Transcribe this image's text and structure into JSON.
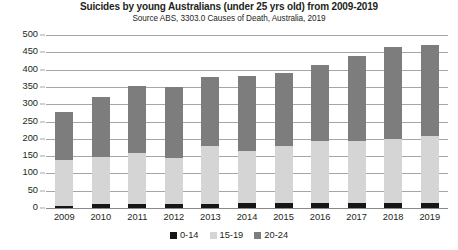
{
  "chart_data": {
    "type": "bar",
    "stacked": true,
    "title": "Suicides by young Australians (under 25 yrs old) from 2009-2019",
    "subtitle": "Source ABS, 3303.0 Causes of Death, Australia, 2019",
    "xlabel": "",
    "ylabel": "",
    "ylim": [
      0,
      500
    ],
    "ytick_step": 50,
    "yticks": [
      0,
      50,
      100,
      150,
      200,
      250,
      300,
      350,
      400,
      450,
      500
    ],
    "grid": true,
    "legend_position": "bottom",
    "categories": [
      "2009",
      "2010",
      "2011",
      "2012",
      "2013",
      "2014",
      "2015",
      "2016",
      "2017",
      "2018",
      "2019"
    ],
    "series": [
      {
        "name": "0-14",
        "color": "#161616",
        "values": [
          7,
          12,
          13,
          13,
          13,
          14,
          14,
          15,
          14,
          15,
          15
        ]
      },
      {
        "name": "15-19",
        "color": "#d5d5d5",
        "values": [
          131,
          136,
          147,
          132,
          167,
          151,
          166,
          180,
          181,
          185,
          192
        ]
      },
      {
        "name": "20-24",
        "color": "#7d7d7d",
        "values": [
          139,
          172,
          192,
          205,
          200,
          217,
          210,
          217,
          245,
          265,
          263
        ]
      }
    ],
    "totals": [
      277,
      320,
      352,
      350,
      380,
      382,
      390,
      412,
      440,
      465,
      470
    ]
  },
  "legend": {
    "items": [
      {
        "label": "0-14",
        "color": "#161616"
      },
      {
        "label": "15-19",
        "color": "#d5d5d5"
      },
      {
        "label": "20-24",
        "color": "#7d7d7d"
      }
    ]
  }
}
